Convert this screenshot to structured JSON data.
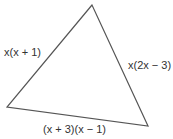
{
  "diagram": {
    "type": "triangle",
    "vertices": {
      "top": [
        92,
        5
      ],
      "left": [
        7,
        107
      ],
      "right": [
        148,
        126
      ]
    },
    "stroke_color": "#555555",
    "sides": {
      "left": {
        "label": "x(x + 1)",
        "prefix": "x",
        "rest": "(x + 1)"
      },
      "right": {
        "label": "x(2x − 3)",
        "prefix": "x",
        "rest": "(2x − 3)"
      },
      "bottom": {
        "label": "(x + 3)(x − 1)"
      }
    }
  }
}
